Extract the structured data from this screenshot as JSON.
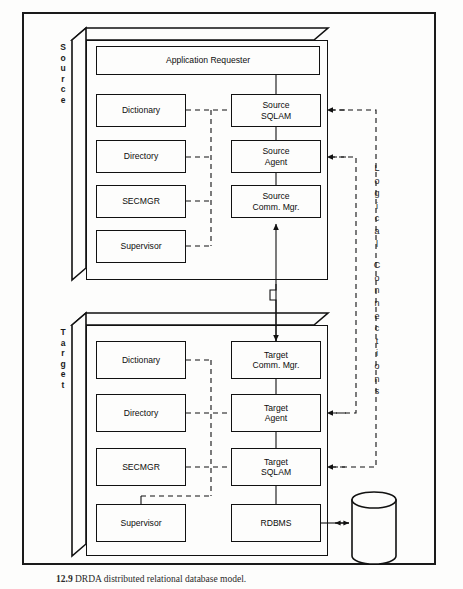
{
  "figure": {
    "caption_number": "12.9",
    "caption_text": "DRDA distributed relational database model.",
    "outer_frame": true
  },
  "colors": {
    "line": "#111111",
    "background": "#fdfdfc",
    "text": "#0d0d0d"
  },
  "source_block": {
    "label": "Source",
    "label_chars": [
      "S",
      "o",
      "u",
      "r",
      "c",
      "e"
    ],
    "components": [
      {
        "name": "application-requester",
        "label": "Application Requester"
      },
      {
        "name": "dictionary",
        "label": "Dictionary"
      },
      {
        "name": "directory",
        "label": "Directory"
      },
      {
        "name": "secmgr",
        "label": "SECMGR"
      },
      {
        "name": "supervisor",
        "label": "Supervisor"
      },
      {
        "name": "source-sqlam",
        "label": "Source\nSQLAM"
      },
      {
        "name": "source-agent",
        "label": "Source\nAgent"
      },
      {
        "name": "source-comm-mgr",
        "label": "Source\nComm. Mgr."
      }
    ]
  },
  "target_block": {
    "label": "Target",
    "label_chars": [
      "T",
      "a",
      "r",
      "g",
      "e",
      "t"
    ],
    "components": [
      {
        "name": "dictionary",
        "label": "Dictionary"
      },
      {
        "name": "directory",
        "label": "Directory"
      },
      {
        "name": "secmgr",
        "label": "SECMGR"
      },
      {
        "name": "supervisor",
        "label": "Supervisor"
      },
      {
        "name": "target-comm-mgr",
        "label": "Target\nComm. Mgr."
      },
      {
        "name": "target-agent",
        "label": "Target\nAgent"
      },
      {
        "name": "target-sqlam",
        "label": "Target\nSQLAM"
      },
      {
        "name": "rdbms",
        "label": "RDBMS"
      }
    ]
  },
  "database": {
    "label": "RDB"
  },
  "logical_connections": {
    "label": "Logical Connections",
    "line1_chars": [
      "L",
      "o",
      "g",
      "i",
      "c",
      "a",
      "l"
    ],
    "line2_chars": [
      "C",
      "o",
      "n",
      "n",
      "e",
      "c",
      "t",
      "i",
      "o",
      "n",
      "s"
    ]
  },
  "labels": {
    "application_requester": "Application Requester",
    "dictionary": "Dictionary",
    "directory": "Directory",
    "secmgr": "SECMGR",
    "supervisor": "Supervisor",
    "source_sqlam": "Source\nSQLAM",
    "source_agent": "Source\nAgent",
    "source_comm_mgr": "Source\nComm. Mgr.",
    "target_comm_mgr": "Target\nComm. Mgr.",
    "target_agent": "Target\nAgent",
    "target_sqlam": "Target\nSQLAM",
    "rdbms": "RDBMS",
    "rdb": "RDB"
  }
}
